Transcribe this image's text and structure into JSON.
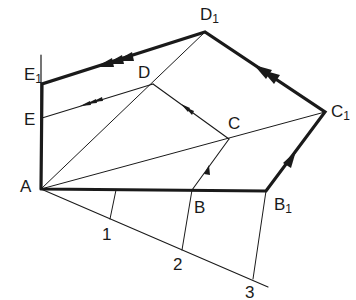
{
  "diagram": {
    "type": "geometric-construction",
    "colors": {
      "stroke": "#1a1a1a",
      "background": "#ffffff"
    },
    "points": {
      "A": {
        "label": "A",
        "sub": "",
        "x": 41,
        "y": 189
      },
      "B": {
        "label": "B",
        "sub": "",
        "x": 192,
        "y": 190
      },
      "C": {
        "label": "C",
        "sub": "",
        "x": 229,
        "y": 139
      },
      "D": {
        "label": "D",
        "sub": "",
        "x": 153,
        "y": 84
      },
      "E": {
        "label": "E",
        "sub": "",
        "x": 42,
        "y": 118
      },
      "B1": {
        "label": "B",
        "sub": "1",
        "x": 266,
        "y": 191
      },
      "C1": {
        "label": "C",
        "sub": "1",
        "x": 325,
        "y": 112
      },
      "D1": {
        "label": "D",
        "sub": "1",
        "x": 205,
        "y": 32
      },
      "E1": {
        "label": "E",
        "sub": "1",
        "x": 42,
        "y": 84
      },
      "P1": {
        "label": "1",
        "sub": "",
        "x": 110,
        "y": 219
      },
      "P2": {
        "label": "2",
        "sub": "",
        "x": 182,
        "y": 250
      },
      "P3": {
        "label": "3",
        "sub": "",
        "x": 253,
        "y": 279
      }
    },
    "labels": {
      "A": "A",
      "B": "B",
      "C": "C",
      "D": "D",
      "E": "E",
      "B1": "B",
      "C1": "C",
      "D1": "D",
      "E1": "E",
      "sub1": "1",
      "n1": "1",
      "n2": "2",
      "n3": "3"
    },
    "thick_path": [
      "A",
      "B1",
      "C1",
      "D1",
      "E1",
      "A"
    ],
    "thin_lines": [
      [
        "A",
        "D1"
      ],
      [
        "A",
        "C1"
      ],
      [
        "E",
        "D"
      ],
      [
        "D",
        "C"
      ],
      [
        "C",
        "B"
      ],
      [
        "A",
        "P3ext"
      ],
      [
        "P1",
        "AB"
      ],
      [
        "P2",
        "B"
      ],
      [
        "P3",
        "B1"
      ],
      [
        "E1",
        "top"
      ]
    ],
    "arrows": [
      {
        "segment": "B1-C1",
        "count": 1
      },
      {
        "segment": "C1-D1",
        "count": 2
      },
      {
        "segment": "D1-E1",
        "count": 3
      },
      {
        "segment": "B-C",
        "count": 1
      },
      {
        "segment": "C-D",
        "count": 2
      },
      {
        "segment": "D-E",
        "count": 3
      }
    ]
  }
}
